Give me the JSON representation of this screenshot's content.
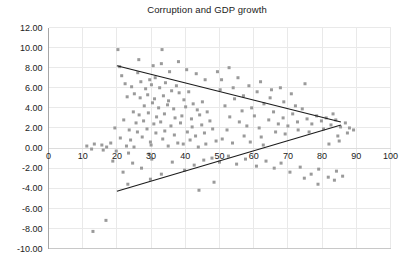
{
  "chart_data": {
    "type": "scatter",
    "title": "Corruption and GDP growth",
    "xlabel": "",
    "ylabel": "",
    "xlim": [
      0,
      100
    ],
    "ylim": [
      -10,
      12
    ],
    "xticks": [
      0,
      10,
      20,
      30,
      40,
      50,
      60,
      70,
      80,
      90,
      100
    ],
    "xtick_labels": [
      "0",
      "10",
      "20",
      "30",
      "40",
      "50",
      "60",
      "70",
      "80",
      "90",
      "100"
    ],
    "yticks": [
      12,
      10,
      8,
      6,
      4,
      2,
      0,
      -2,
      -4,
      -6,
      -8,
      -10
    ],
    "ytick_labels": [
      "12.00",
      "10.00",
      "8.00",
      "6.00",
      "4.00",
      "2.00",
      "0.00",
      "-2.00",
      "-4.00",
      "-6.00",
      "-8.00",
      "-10.00"
    ],
    "grid": true,
    "legend": null,
    "marker_color": "#9a9a9a",
    "trend_color": "#1b1b1b",
    "series": [
      {
        "name": "countries",
        "points": [
          [
            20.3,
            9.8
          ],
          [
            33.2,
            9.8
          ],
          [
            33.0,
            8.4
          ],
          [
            20.8,
            8.1
          ],
          [
            21.4,
            7.2
          ],
          [
            26.1,
            7.5
          ],
          [
            35.4,
            7.6
          ],
          [
            29.6,
            6.8
          ],
          [
            31.2,
            7.0
          ],
          [
            22.4,
            6.4
          ],
          [
            24.3,
            6.1
          ],
          [
            27.0,
            6.6
          ],
          [
            28.4,
            5.9
          ],
          [
            30.1,
            6.3
          ],
          [
            32.5,
            6.0
          ],
          [
            34.2,
            6.5
          ],
          [
            36.0,
            5.7
          ],
          [
            37.4,
            6.2
          ],
          [
            25.1,
            5.4
          ],
          [
            23.0,
            5.1
          ],
          [
            26.8,
            5.0
          ],
          [
            29.0,
            5.3
          ],
          [
            31.0,
            4.9
          ],
          [
            33.6,
            5.2
          ],
          [
            35.1,
            4.7
          ],
          [
            38.2,
            5.5
          ],
          [
            39.6,
            4.8
          ],
          [
            41.0,
            5.6
          ],
          [
            42.3,
            4.4
          ],
          [
            28.0,
            4.2
          ],
          [
            30.4,
            4.5
          ],
          [
            32.2,
            4.0
          ],
          [
            34.8,
            4.3
          ],
          [
            36.6,
            3.9
          ],
          [
            40.1,
            4.1
          ],
          [
            43.5,
            3.8
          ],
          [
            45.0,
            4.6
          ],
          [
            24.8,
            3.6
          ],
          [
            26.5,
            3.3
          ],
          [
            29.2,
            3.5
          ],
          [
            31.6,
            3.1
          ],
          [
            33.9,
            3.4
          ],
          [
            37.0,
            3.0
          ],
          [
            39.0,
            3.2
          ],
          [
            41.8,
            2.9
          ],
          [
            44.2,
            3.3
          ],
          [
            46.4,
            3.6
          ],
          [
            22.0,
            2.8
          ],
          [
            25.6,
            2.5
          ],
          [
            27.8,
            2.7
          ],
          [
            30.8,
            2.4
          ],
          [
            32.8,
            2.6
          ],
          [
            35.8,
            2.2
          ],
          [
            38.6,
            2.5
          ],
          [
            42.0,
            2.1
          ],
          [
            44.8,
            2.3
          ],
          [
            47.2,
            2.7
          ],
          [
            19.4,
            2.0
          ],
          [
            23.6,
            1.8
          ],
          [
            26.0,
            1.6
          ],
          [
            28.8,
            1.9
          ],
          [
            31.4,
            1.5
          ],
          [
            34.0,
            1.7
          ],
          [
            36.8,
            1.3
          ],
          [
            40.6,
            1.6
          ],
          [
            43.0,
            1.2
          ],
          [
            45.6,
            1.5
          ],
          [
            48.0,
            1.9
          ],
          [
            21.0,
            1.0
          ],
          [
            24.0,
            0.8
          ],
          [
            27.4,
            1.1
          ],
          [
            29.8,
            0.6
          ],
          [
            33.4,
            0.9
          ],
          [
            37.8,
            0.5
          ],
          [
            41.4,
            0.8
          ],
          [
            46.0,
            0.4
          ],
          [
            49.0,
            0.7
          ],
          [
            15.6,
            0.3
          ],
          [
            18.2,
            0.5
          ],
          [
            22.8,
            0.2
          ],
          [
            25.0,
            0.1
          ],
          [
            30.0,
            0.3
          ],
          [
            35.0,
            0.2
          ],
          [
            39.4,
            0.4
          ],
          [
            43.8,
            0.1
          ],
          [
            11.2,
            0.2
          ],
          [
            13.4,
            0.4
          ],
          [
            17.0,
            0.1
          ],
          [
            19.8,
            -0.3
          ],
          [
            23.4,
            -0.5
          ],
          [
            29.4,
            -0.6
          ],
          [
            16.0,
            -0.2
          ],
          [
            12.6,
            -0.1
          ],
          [
            50.2,
            5.8
          ],
          [
            51.6,
            4.2
          ],
          [
            53.0,
            3.1
          ],
          [
            54.4,
            4.9
          ],
          [
            55.8,
            2.6
          ],
          [
            52.2,
            1.8
          ],
          [
            56.6,
            3.7
          ],
          [
            58.0,
            2.2
          ],
          [
            59.4,
            4.0
          ],
          [
            50.8,
            0.9
          ],
          [
            53.8,
            0.5
          ],
          [
            57.2,
            1.2
          ],
          [
            60.2,
            3.2
          ],
          [
            61.6,
            2.0
          ],
          [
            63.0,
            4.4
          ],
          [
            64.4,
            2.8
          ],
          [
            62.2,
            1.1
          ],
          [
            65.8,
            3.6
          ],
          [
            67.2,
            2.4
          ],
          [
            59.0,
            0.6
          ],
          [
            62.8,
            0.3
          ],
          [
            66.4,
            1.6
          ],
          [
            68.6,
            3.0
          ],
          [
            70.0,
            2.2
          ],
          [
            71.4,
            3.4
          ],
          [
            69.2,
            1.4
          ],
          [
            72.8,
            2.6
          ],
          [
            74.2,
            3.9
          ],
          [
            73.0,
            1.8
          ],
          [
            75.6,
            2.9
          ],
          [
            77.0,
            2.4
          ],
          [
            78.4,
            3.2
          ],
          [
            76.2,
            1.6
          ],
          [
            79.8,
            2.7
          ],
          [
            81.2,
            3.0
          ],
          [
            82.6,
            2.3
          ],
          [
            80.4,
            1.9
          ],
          [
            84.0,
            2.8
          ],
          [
            85.4,
            2.1
          ],
          [
            83.2,
            3.4
          ],
          [
            86.8,
            2.5
          ],
          [
            88.0,
            2.0
          ],
          [
            84.6,
            1.2
          ],
          [
            87.4,
            1.5
          ],
          [
            89.2,
            1.8
          ],
          [
            85.0,
            0.7
          ],
          [
            82.0,
            0.4
          ],
          [
            47.8,
            -1.0
          ],
          [
            50.0,
            -1.4
          ],
          [
            52.6,
            -0.8
          ],
          [
            55.0,
            -1.6
          ],
          [
            57.6,
            -1.1
          ],
          [
            60.8,
            -1.8
          ],
          [
            63.6,
            -1.3
          ],
          [
            66.0,
            -2.0
          ],
          [
            68.0,
            -1.5
          ],
          [
            70.6,
            -2.4
          ],
          [
            73.6,
            -1.9
          ],
          [
            76.8,
            -2.6
          ],
          [
            79.0,
            -2.1
          ],
          [
            81.8,
            -2.9
          ],
          [
            84.2,
            -2.3
          ],
          [
            45.4,
            -1.2
          ],
          [
            42.6,
            -1.7
          ],
          [
            39.8,
            -2.2
          ],
          [
            36.2,
            -1.4
          ],
          [
            33.0,
            -2.6
          ],
          [
            30.2,
            -1.1
          ],
          [
            27.2,
            -2.0
          ],
          [
            24.6,
            -1.5
          ],
          [
            21.8,
            -2.4
          ],
          [
            18.8,
            -1.3
          ],
          [
            23.2,
            -3.6
          ],
          [
            29.8,
            -3.1
          ],
          [
            48.4,
            -3.4
          ],
          [
            44.0,
            -4.2
          ],
          [
            13.0,
            -8.3
          ],
          [
            16.8,
            -7.2
          ],
          [
            74.8,
            -3.0
          ],
          [
            78.8,
            -3.6
          ],
          [
            83.6,
            -3.2
          ],
          [
            86.0,
            -2.8
          ],
          [
            54.0,
            6.0
          ],
          [
            57.0,
            5.2
          ],
          [
            61.0,
            5.6
          ],
          [
            64.8,
            5.0
          ],
          [
            68.8,
            4.6
          ],
          [
            72.2,
            4.2
          ],
          [
            50.6,
            6.8
          ],
          [
            58.6,
            6.2
          ],
          [
            65.2,
            5.8
          ],
          [
            71.0,
            5.4
          ],
          [
            75.0,
            6.4
          ],
          [
            62.0,
            6.6
          ],
          [
            55.4,
            7.0
          ],
          [
            67.8,
            6.0
          ],
          [
            45.8,
            6.8
          ],
          [
            43.2,
            7.4
          ],
          [
            40.4,
            7.8
          ],
          [
            38.0,
            8.6
          ],
          [
            30.6,
            8.2
          ],
          [
            26.4,
            8.8
          ],
          [
            49.4,
            7.6
          ],
          [
            52.8,
            8.0
          ]
        ]
      }
    ],
    "trendlines": [
      {
        "name": "upper-envelope",
        "x0": 20.0,
        "y0": 8.2,
        "x1": 85.5,
        "y1": 2.6
      },
      {
        "name": "lower-envelope",
        "x0": 20.0,
        "y0": -4.3,
        "x1": 85.5,
        "y1": 2.3
      }
    ]
  }
}
